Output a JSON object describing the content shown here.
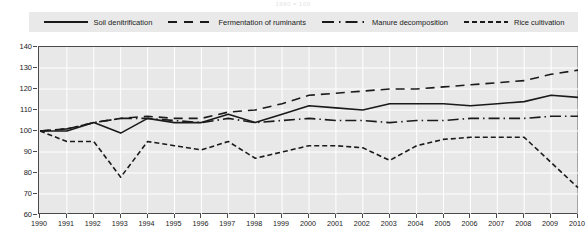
{
  "header": {
    "note": "1990 = 100"
  },
  "legend": {
    "position": "top",
    "items": [
      {
        "label": "Soil denitrification",
        "style": "solid",
        "icon": "solid-line-icon"
      },
      {
        "label": "Fermentation of ruminants",
        "style": "dashed",
        "icon": "dashed-line-icon"
      },
      {
        "label": "Manure decomposition",
        "style": "dash-dot",
        "icon": "dash-dot-line-icon"
      },
      {
        "label": "Rice cultivation",
        "style": "fine-dash",
        "icon": "fine-dashed-line-icon"
      }
    ]
  },
  "axes": {
    "y_ticks": [
      140,
      130,
      120,
      110,
      100,
      90,
      80,
      70,
      60
    ],
    "x_ticks": [
      "1990",
      "1991",
      "1992",
      "1993",
      "1994",
      "1995",
      "1996",
      "1997",
      "1998",
      "1999",
      "2000",
      "2001",
      "2002",
      "2003",
      "2004",
      "2005",
      "2006",
      "2007",
      "2008",
      "2009",
      "2010"
    ]
  },
  "colors": {
    "line": "#1a1a1a",
    "plot_background": "#e8e8e8",
    "gridline": "#ffffff",
    "axis": "#4a4a4a",
    "legend_background": "#e9e9e9"
  },
  "chart_data": {
    "type": "line",
    "title": "1990 = 100",
    "xlabel": "",
    "ylabel": "",
    "xlim": [
      1990,
      2010
    ],
    "ylim": [
      60,
      140
    ],
    "grid": true,
    "legend_position": "top",
    "x": [
      1990,
      1991,
      1992,
      1993,
      1994,
      1995,
      1996,
      1997,
      1998,
      1999,
      2000,
      2001,
      2002,
      2003,
      2004,
      2005,
      2006,
      2007,
      2008,
      2009,
      2010
    ],
    "series": [
      {
        "name": "Soil denitrification",
        "style": "solid",
        "values": [
          100,
          100,
          104,
          99,
          106,
          104,
          104,
          108,
          104,
          108,
          112,
          111,
          110,
          113,
          113,
          113,
          112,
          113,
          114,
          117,
          116
        ]
      },
      {
        "name": "Fermentation of ruminants",
        "style": "dashed",
        "values": [
          100,
          101,
          104,
          106,
          107,
          106,
          106,
          109,
          110,
          113,
          117,
          118,
          119,
          120,
          120,
          121,
          122,
          123,
          124,
          127,
          129
        ]
      },
      {
        "name": "Manure decomposition",
        "style": "dash-dot",
        "values": [
          100,
          101,
          104,
          106,
          106,
          105,
          104,
          106,
          104,
          105,
          106,
          105,
          105,
          104,
          105,
          105,
          106,
          106,
          106,
          107,
          107
        ]
      },
      {
        "name": "Rice cultivation",
        "style": "fine-dash",
        "values": [
          100,
          95,
          95,
          78,
          95,
          93,
          91,
          95,
          87,
          90,
          93,
          93,
          92,
          86,
          93,
          96,
          97,
          97,
          97,
          85,
          73
        ]
      }
    ]
  }
}
